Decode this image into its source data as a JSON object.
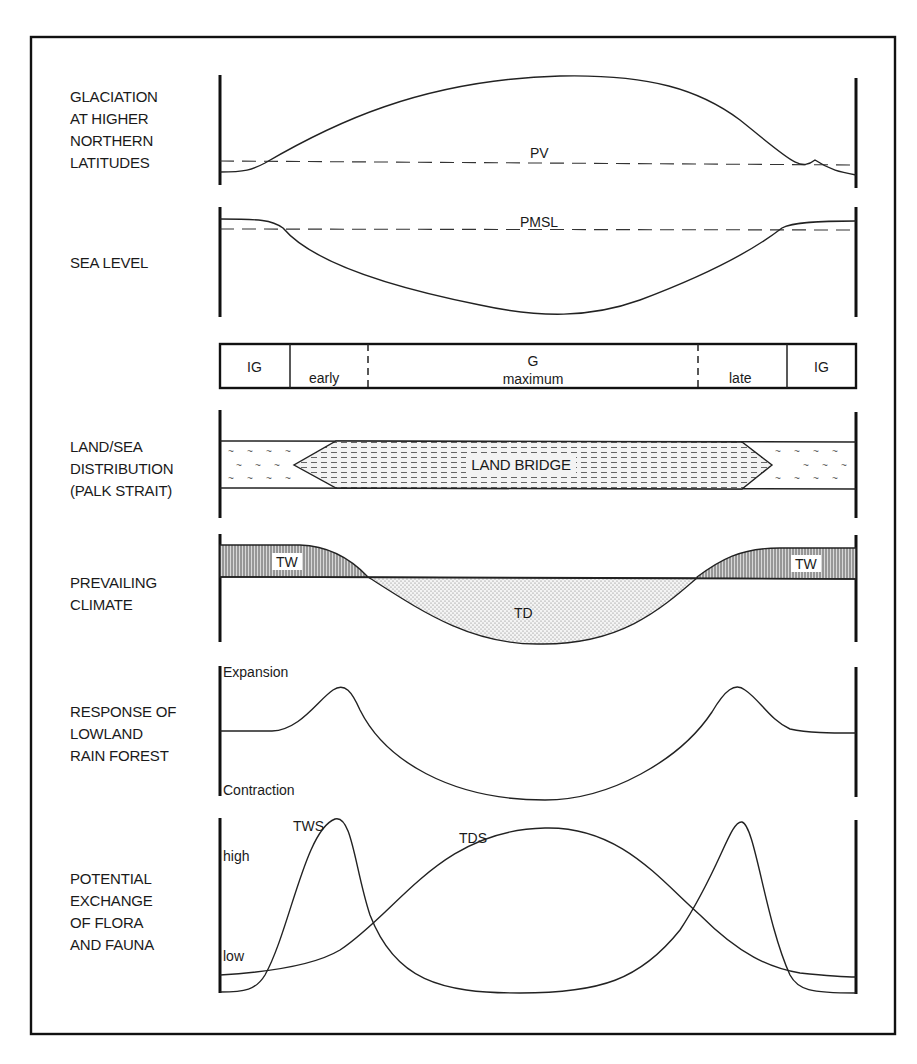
{
  "panels": {
    "glaciation": {
      "label_lines": [
        "GLACIATION",
        "AT HIGHER",
        "NORTHERN",
        "LATITUDES"
      ],
      "reference_line": "PV"
    },
    "sea_level": {
      "label_lines": [
        "SEA LEVEL"
      ],
      "reference_line": "PMSL"
    },
    "phases": {
      "segments": [
        {
          "top": "IG",
          "bottom": ""
        },
        {
          "top": "",
          "bottom": "early"
        },
        {
          "top": "G",
          "bottom": "maximum"
        },
        {
          "top": "",
          "bottom": "late"
        },
        {
          "top": "IG",
          "bottom": ""
        }
      ]
    },
    "land_sea": {
      "label_lines": [
        "LAND/SEA",
        "DISTRIBUTION",
        "(PALK STRAIT)"
      ],
      "center_label": "LAND BRIDGE"
    },
    "climate": {
      "label_lines": [
        "PREVAILING",
        "CLIMATE"
      ],
      "left_label": "TW",
      "right_label": "TW",
      "center_label": "TD"
    },
    "rain_forest": {
      "label_lines": [
        "RESPONSE OF",
        "LOWLAND",
        "RAIN FOREST"
      ],
      "top_axis_label": "Expansion",
      "bottom_axis_label": "Contraction"
    },
    "exchange": {
      "label_lines": [
        "POTENTIAL",
        "EXCHANGE",
        "OF FLORA",
        "AND FAUNA"
      ],
      "high_label": "high",
      "low_label": "low",
      "series": [
        "TWS",
        "TDS"
      ]
    }
  },
  "colors": {
    "ink": "#1a1a1a",
    "hatch_fill": "#9a9a9a",
    "stipple_fill": "#c8c8c8",
    "background": "#ffffff"
  }
}
